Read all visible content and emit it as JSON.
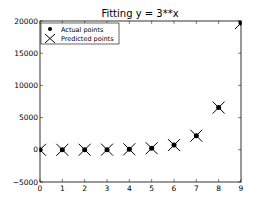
{
  "chart_data": {
    "type": "scatter",
    "title": "Fitting y = 3**x",
    "xlabel": "",
    "ylabel": "",
    "xlim": [
      0,
      9
    ],
    "ylim": [
      -5000,
      20000
    ],
    "xticks": [
      "0",
      "1",
      "2",
      "3",
      "4",
      "5",
      "6",
      "7",
      "8",
      "9"
    ],
    "yticks": [
      "-5000",
      "0",
      "5000",
      "10000",
      "15000",
      "20000"
    ],
    "grid": false,
    "legend_position": "upper left",
    "series": [
      {
        "name": "Actual points",
        "marker": "circle",
        "x": [
          0,
          1,
          2,
          3,
          4,
          5,
          6,
          7,
          8,
          9
        ],
        "values": [
          1,
          3,
          9,
          27,
          81,
          243,
          729,
          2187,
          6561,
          19683
        ]
      },
      {
        "name": "Predicted points",
        "marker": "x",
        "x": [
          0,
          1,
          2,
          3,
          4,
          5,
          6,
          7,
          8,
          9
        ],
        "values": [
          1,
          3,
          9,
          27,
          81,
          243,
          729,
          2187,
          6561,
          19683
        ]
      }
    ]
  },
  "legend": {
    "items": [
      {
        "label": "Actual points"
      },
      {
        "label": "Predicted points"
      }
    ]
  }
}
